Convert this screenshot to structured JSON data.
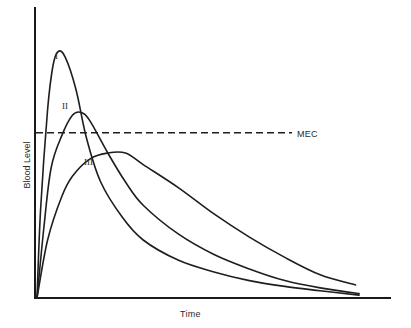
{
  "chart_data": {
    "type": "line",
    "title": "",
    "xlabel": "Time",
    "ylabel": "Blood Level",
    "grid": false,
    "legend": "none (curves labeled inline)",
    "x_ticks": [],
    "y_ticks": [],
    "xlim": [
      0,
      100
    ],
    "ylim": [
      0,
      100
    ],
    "reference_lines": [
      {
        "label": "MEC",
        "orientation": "horizontal",
        "y": 57,
        "style": "dashed"
      }
    ],
    "series": [
      {
        "name": "I",
        "points": [
          [
            0,
            0
          ],
          [
            1,
            30
          ],
          [
            3,
            65
          ],
          [
            4.5,
            80
          ],
          [
            6,
            85
          ],
          [
            8,
            83
          ],
          [
            11,
            72
          ],
          [
            14,
            55
          ],
          [
            18,
            40
          ],
          [
            24,
            28
          ],
          [
            30,
            20
          ],
          [
            40,
            13
          ],
          [
            50,
            9
          ],
          [
            60,
            6
          ],
          [
            70,
            4
          ],
          [
            80,
            2.5
          ],
          [
            91,
            1
          ]
        ]
      },
      {
        "name": "II",
        "points": [
          [
            0,
            0
          ],
          [
            2,
            25
          ],
          [
            4,
            45
          ],
          [
            7,
            56
          ],
          [
            10,
            63
          ],
          [
            12.5,
            64
          ],
          [
            15,
            61
          ],
          [
            20,
            50
          ],
          [
            25,
            40
          ],
          [
            30,
            32
          ],
          [
            40,
            22
          ],
          [
            50,
            15
          ],
          [
            60,
            10
          ],
          [
            70,
            6
          ],
          [
            80,
            3.5
          ],
          [
            91,
            1.5
          ]
        ]
      },
      {
        "name": "III",
        "points": [
          [
            0,
            0
          ],
          [
            3,
            20
          ],
          [
            7,
            35
          ],
          [
            10,
            42
          ],
          [
            15,
            48
          ],
          [
            20,
            50
          ],
          [
            25,
            50
          ],
          [
            30,
            46
          ],
          [
            40,
            38
          ],
          [
            50,
            29
          ],
          [
            60,
            21
          ],
          [
            70,
            14
          ],
          [
            80,
            8
          ],
          [
            90,
            4.5
          ]
        ]
      }
    ],
    "annotations": [
      "I",
      "II",
      "III",
      "MEC"
    ]
  },
  "labels": {
    "x_axis": "Time",
    "y_axis": "Blood Level",
    "mec": "MEC",
    "curve_1": "I",
    "curve_2": "II",
    "curve_3": "III"
  },
  "layout": {
    "origin_px": [
      37,
      298
    ],
    "x_end_px": 391,
    "y_top_px": 8,
    "plot_width_px": 354,
    "plot_height_px": 290
  }
}
